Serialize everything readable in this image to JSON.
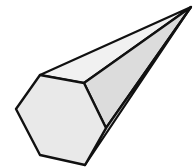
{
  "figure": {
    "title": "Hexagonal pyramid",
    "stroke_color": "#111111",
    "colors": {
      "base_face": "#e9e9e9",
      "top_lateral_face": "#f1f1f1",
      "right_lateral_face": "#dcdcdc",
      "background": "#ffffff"
    },
    "apex": [
      191,
      7
    ],
    "base_vertices": [
      [
        40,
        75
      ],
      [
        84,
        83
      ],
      [
        106,
        128
      ],
      [
        85,
        165
      ],
      [
        40,
        155
      ],
      [
        16,
        109
      ]
    ]
  }
}
